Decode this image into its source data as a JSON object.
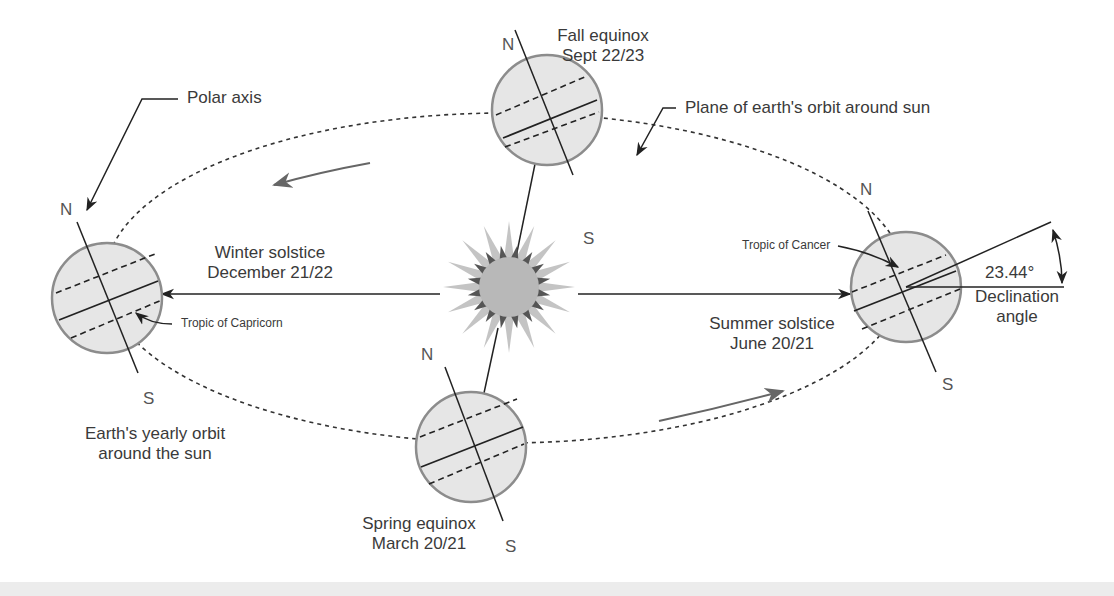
{
  "diagram": {
    "title_hint": "Earth's orbit and seasons",
    "labels": {
      "polar_axis": "Polar axis",
      "fall_equinox": [
        "Fall equinox",
        "Sept 22/23"
      ],
      "plane_of_orbit": "Plane of earth's orbit around sun",
      "winter_solstice": [
        "Winter solstice",
        "December 21/22"
      ],
      "tropic_of_capricorn": "Tropic of Capricorn",
      "tropic_of_cancer": "Tropic of Cancer",
      "summer_solstice": [
        "Summer solstice",
        "June 20/21"
      ],
      "declination_value": "23.44°",
      "declination_label": [
        "Declination",
        "angle"
      ],
      "yearly_orbit": [
        "Earth's yearly orbit",
        "around the sun"
      ],
      "spring_equinox": [
        "Spring equinox",
        "March 20/21"
      ]
    },
    "poles": {
      "north": "N",
      "south": "S"
    },
    "earths": [
      {
        "name": "winter",
        "cx": 107,
        "cy": 298
      },
      {
        "name": "fall",
        "cx": 547,
        "cy": 110
      },
      {
        "name": "spring",
        "cx": 471,
        "cy": 447
      },
      {
        "name": "summer",
        "cx": 906,
        "cy": 287
      }
    ],
    "sun": {
      "cx": 509,
      "cy": 287
    },
    "colors": {
      "earth_fill": "#e6e6e6",
      "earth_stroke": "#8c8c8c",
      "sun_fill": "#b8b8b8",
      "sun_dark_rays": "#555555",
      "line": "#222222",
      "orbit_arrow": "#666666"
    }
  }
}
